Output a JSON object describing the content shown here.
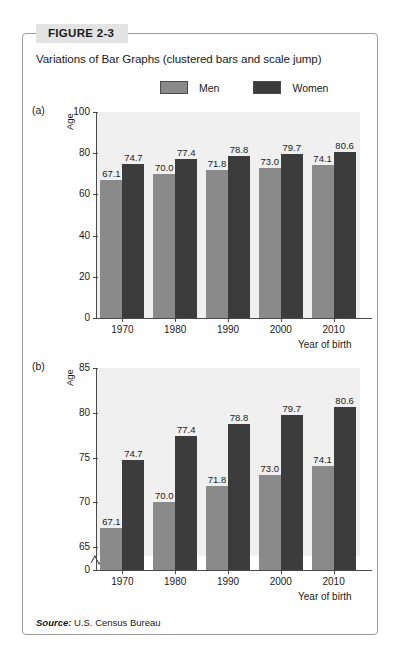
{
  "figure": {
    "tab_label": "FIGURE 2-3",
    "title": "Variations of Bar Graphs (clustered bars and scale jump)",
    "source_prefix": "Source:",
    "source_text": "U.S. Census Bureau"
  },
  "legend": {
    "items": [
      {
        "label": "Men",
        "color": "#8a8a8a"
      },
      {
        "label": "Women",
        "color": "#3c3c3c"
      }
    ]
  },
  "panels": [
    {
      "tag": "(a)"
    },
    {
      "tag": "(b)"
    }
  ],
  "chart_data": [
    {
      "type": "bar",
      "panel": "(a)",
      "title": "",
      "xlabel": "Year of birth",
      "ylabel": "Age",
      "categories": [
        "1970",
        "1980",
        "1990",
        "2000",
        "2010"
      ],
      "series": [
        {
          "name": "Men",
          "color": "#8a8a8a",
          "values": [
            67.1,
            70.0,
            71.8,
            73.0,
            74.1
          ]
        },
        {
          "name": "Women",
          "color": "#3c3c3c",
          "values": [
            74.7,
            77.4,
            78.8,
            79.7,
            80.6
          ]
        }
      ],
      "ylim": [
        0,
        100
      ],
      "yticks": [
        0,
        20,
        40,
        60,
        80,
        100
      ],
      "grid": false,
      "axis_break": false,
      "legend_position": "top"
    },
    {
      "type": "bar",
      "panel": "(b)",
      "title": "",
      "xlabel": "Year of birth",
      "ylabel": "Age",
      "categories": [
        "1970",
        "1980",
        "1990",
        "2000",
        "2010"
      ],
      "series": [
        {
          "name": "Men",
          "color": "#8a8a8a",
          "values": [
            67.1,
            70.0,
            71.8,
            73.0,
            74.1
          ]
        },
        {
          "name": "Women",
          "color": "#3c3c3c",
          "values": [
            74.7,
            77.4,
            78.8,
            79.7,
            80.6
          ]
        }
      ],
      "ylim": [
        64,
        85
      ],
      "yticks": [
        0,
        65,
        70,
        75,
        80,
        85
      ],
      "grid": false,
      "axis_break": true,
      "legend_position": "top"
    }
  ]
}
